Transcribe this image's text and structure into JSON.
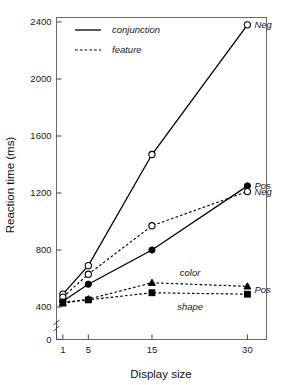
{
  "chart_data": {
    "type": "line",
    "title": "",
    "xlabel": "Display size",
    "ylabel": "Reaction time (ms)",
    "x": [
      1,
      5,
      15,
      30
    ],
    "xtick_labels": [
      "1",
      "5",
      "15",
      "30"
    ],
    "ytick_labels": [
      "0",
      "400",
      "800",
      "1200",
      "1600",
      "2000",
      "2400"
    ],
    "ytick_values": [
      0,
      400,
      800,
      1200,
      1600,
      2000,
      2400
    ],
    "xlim": [
      0,
      33
    ],
    "ylim": [
      0,
      2400
    ],
    "grid": false,
    "axis_break": true,
    "axis_break_note": "y-axis broken between 0 and 400",
    "legend_position": "top-left inside axes",
    "legend": [
      {
        "label": "conjunction",
        "linestyle": "solid"
      },
      {
        "label": "feature",
        "linestyle": "dashed"
      }
    ],
    "series": [
      {
        "name": "conjunction negative",
        "label": "Neg",
        "linestyle": "solid",
        "marker": "open-circle",
        "values": [
          490,
          690,
          1470,
          2380
        ]
      },
      {
        "name": "conjunction positive",
        "label": "Pos",
        "linestyle": "solid",
        "marker": "filled-circle",
        "values": [
          440,
          560,
          800,
          1250
        ]
      },
      {
        "name": "feature negative",
        "label": "Neg",
        "linestyle": "dashed",
        "marker": "open-circle",
        "values": [
          470,
          630,
          970,
          1210
        ]
      },
      {
        "name": "feature color positive",
        "label": "color",
        "linestyle": "dashed",
        "marker": "filled-triangle",
        "values": [
          425,
          455,
          570,
          545
        ]
      },
      {
        "name": "feature shape positive",
        "label": "shape",
        "linestyle": "dashed",
        "marker": "filled-square",
        "values": [
          435,
          450,
          500,
          490
        ]
      }
    ],
    "annotations": [
      {
        "text": "Neg",
        "x": 30,
        "y": 2380,
        "series": "conjunction negative"
      },
      {
        "text": "Pos",
        "x": 30,
        "y": 1250,
        "series": "conjunction positive"
      },
      {
        "text": "Neg",
        "x": 30,
        "y": 1210,
        "series": "feature negative"
      },
      {
        "text": "color",
        "x": 21,
        "y": 640,
        "series": "feature color positive"
      },
      {
        "text": "shape",
        "x": 21,
        "y": 405,
        "series": "feature shape positive"
      },
      {
        "text": "Pos",
        "x": 30,
        "y": 520,
        "series": "feature positive group"
      }
    ],
    "colors": {
      "line": "#000000",
      "frame": "#6b6b6b",
      "text": "#1a1a1a",
      "background": "#ffffff"
    }
  }
}
